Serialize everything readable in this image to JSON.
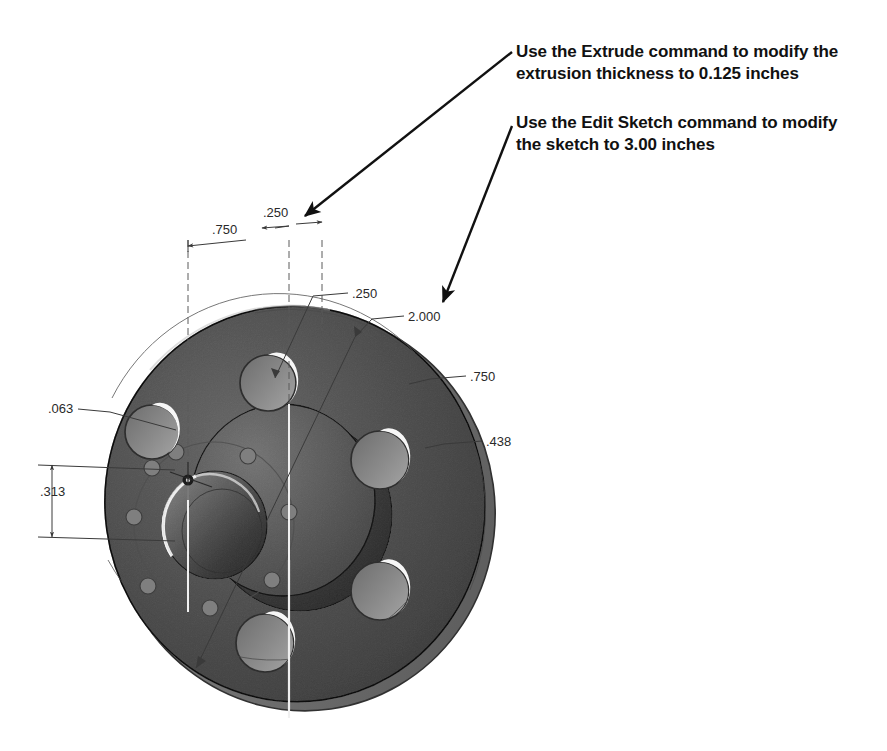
{
  "document": {
    "kind": "cad-3d-shaded-view",
    "background_color": "#ffffff",
    "part_description": "Shaded isometric view of a circular extruded flange with central raised hub, central bore, an inner bolt circle of small holes and five large bolt holes"
  },
  "annotations": [
    {
      "id": "extrude",
      "text": "Use the Extrude command to modify the\nextrusion thickness to 0.125 inches",
      "color": "#111111",
      "leader": {
        "from_x": 512,
        "from_y": 52,
        "to_x": 300,
        "to_y": 219
      }
    },
    {
      "id": "sketch",
      "text": "Use the Edit Sketch command to modify\nthe sketch to 3.00 inches",
      "color": "#111111",
      "leader": {
        "from_x": 512,
        "from_y": 126,
        "to_x": 440,
        "to_y": 306
      }
    }
  ],
  "dimensions": [
    {
      "id": "dim-750-top",
      "label": ".750",
      "x": 212,
      "y": 229
    },
    {
      "id": "dim-250-top",
      "label": ".250",
      "x": 263,
      "y": 212
    },
    {
      "id": "dim-250-right",
      "label": ".250",
      "x": 352,
      "y": 293
    },
    {
      "id": "dim-2000",
      "label": "2.000",
      "x": 408,
      "y": 316
    },
    {
      "id": "dim-750-right",
      "label": ".750",
      "x": 470,
      "y": 376
    },
    {
      "id": "dim-438",
      "label": ".438",
      "x": 486,
      "y": 441
    },
    {
      "id": "dim-063",
      "label": ".063",
      "x": 48,
      "y": 408
    },
    {
      "id": "dim-313",
      "label": ".313",
      "x": 40,
      "y": 491
    }
  ],
  "colors": {
    "part_face": "#8e8e8e",
    "part_face_light": "#a6a6a6",
    "part_face_dark": "#6e6e6e",
    "rim_edge": "#676767",
    "hub_top": "#9b9b9b",
    "bore_shadow": "#707070",
    "hole_highlight": "#f2f2f2",
    "outline": "#2f2f2f",
    "dimension_line": "#3a3a3a",
    "annotation_text": "#111111"
  },
  "geometry": {
    "disc": {
      "cx": 297,
      "cy": 505,
      "rx": 192,
      "ry": 200,
      "rotation_deg": -8
    },
    "hub": {
      "cx": 283,
      "cy": 500,
      "rx": 92,
      "ry": 96
    },
    "bore": {
      "cx": 215,
      "cy": 525,
      "rx": 52,
      "ry": 54
    },
    "bolt_holes": [
      {
        "cx": 268,
        "cy": 383,
        "r": 28
      },
      {
        "cx": 152,
        "cy": 432,
        "r": 27
      },
      {
        "cx": 380,
        "cy": 460,
        "r": 29
      },
      {
        "cx": 380,
        "cy": 591,
        "r": 29
      },
      {
        "cx": 265,
        "cy": 643,
        "r": 29
      }
    ],
    "inner_bolt_circle": {
      "cx": 214,
      "cy": 524,
      "rx": 80,
      "ry": 82,
      "hole_count": 8,
      "hole_r": 8
    },
    "origin_marker": {
      "x": 188,
      "y": 480
    }
  }
}
